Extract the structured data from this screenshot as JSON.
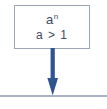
{
  "figure": {
    "node": {
      "line1": {
        "base": "a",
        "exponent": "n",
        "full": "a^n"
      },
      "line2": "a > 1"
    },
    "arrow": {
      "icon": "down-arrow-icon",
      "direction": "down"
    },
    "baseline": {
      "icon": "horizontal-rule"
    },
    "colors": {
      "box_border": "#9aa5b5",
      "box_fill": "#ffffff",
      "text": "#3b4a63",
      "arrow": "#2f5490",
      "rule": "#aab3c6",
      "background": "#ffffff"
    }
  }
}
